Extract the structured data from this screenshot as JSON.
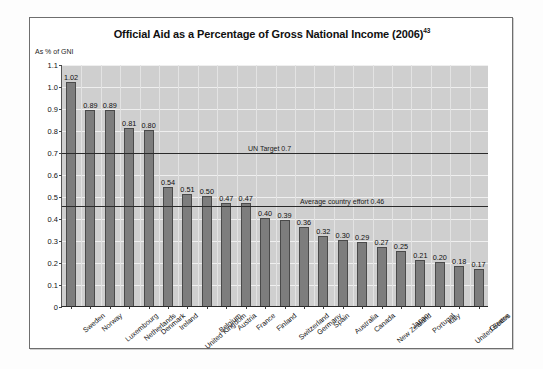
{
  "chart_data": {
    "type": "bar",
    "title": "Official Aid as a Percentage of Gross National Income (2006)",
    "title_footnote": "43",
    "ylabel": "As % of GNI",
    "xlabel": "",
    "ylim": [
      0,
      1.1
    ],
    "ytick_step": 0.1,
    "ytick_labels": [
      "1.1",
      "1.0",
      "0.9",
      "0.8",
      "0.7",
      "0.6",
      "0.5",
      "0.4",
      "0.3",
      "0.2",
      "0.1",
      "0"
    ],
    "grid": true,
    "legend": "none",
    "categories": [
      "Sweden",
      "Norway",
      "Luxembourg",
      "Netherlands",
      "Denmark",
      "Ireland",
      "United Kingdom",
      "Belgium",
      "Austria",
      "France",
      "Finland",
      "Switzerland",
      "Germany",
      "Spain",
      "Australia",
      "Canada",
      "New Zealand",
      "Japan",
      "Portugal",
      "Italy",
      "United States",
      "Greece"
    ],
    "values": [
      1.02,
      0.89,
      0.89,
      0.81,
      0.8,
      0.54,
      0.51,
      0.5,
      0.47,
      0.47,
      0.4,
      0.39,
      0.36,
      0.32,
      0.3,
      0.29,
      0.27,
      0.25,
      0.21,
      0.2,
      0.18,
      0.17
    ],
    "value_labels": [
      "1.02",
      "0.89",
      "0.89",
      "0.81",
      "0.80",
      "0.54",
      "0.51",
      "0.50",
      "0.47",
      "0.47",
      "0.40",
      "0.39",
      "0.36",
      "0.32",
      "0.30",
      "0.29",
      "0.27",
      "0.25",
      "0.21",
      "0.20",
      "0.18",
      "0.17"
    ],
    "annotations": [
      {
        "label": "UN Target 0.7",
        "value": 0.7
      },
      {
        "label": "Average country effort 0.46",
        "value": 0.46
      }
    ],
    "colors": {
      "bar_fill": "#7d7d7d",
      "bar_edge": "#4a4a4a",
      "plot_background": "#cfcfcf",
      "gridline": "#efefef",
      "reference_line": "#2b2b2b",
      "text": "#101010"
    }
  }
}
